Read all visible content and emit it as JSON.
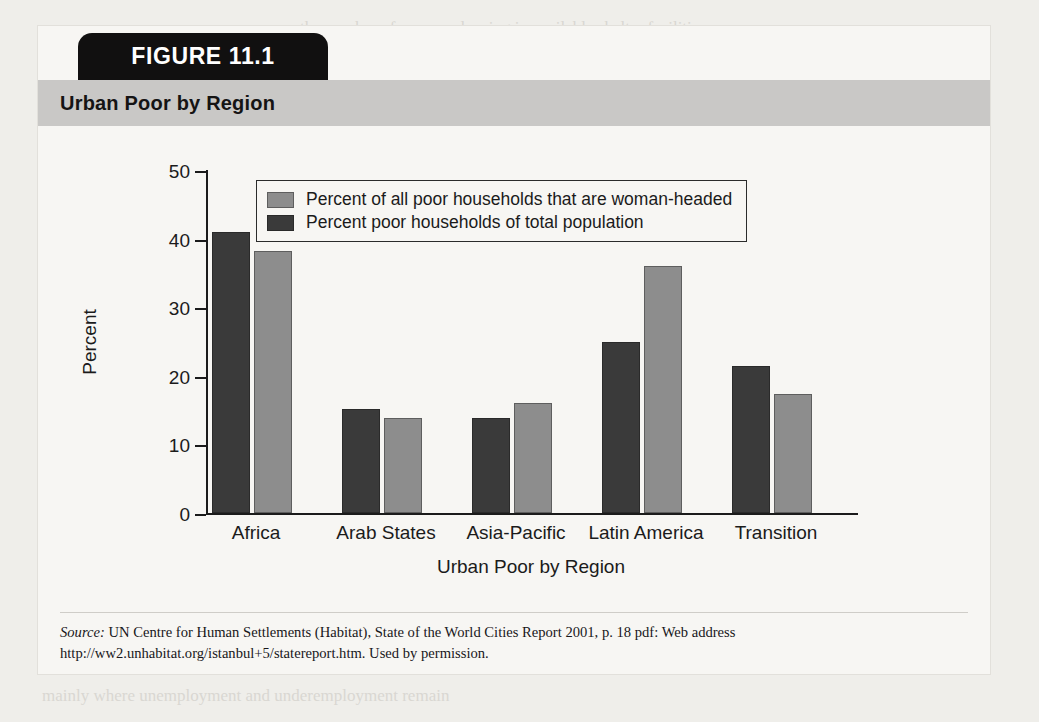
{
  "figure": {
    "tab_label": "FIGURE 11.1",
    "title": "Urban Poor by Region"
  },
  "source": {
    "prefix": "Source:",
    "text": " UN Centre for Human Settlements (Habitat), State of the World Cities Report 2001, p. 18 pdf: Web address http://ww2.unhabitat.org/istanbul+5/statereport.htm. Used by permission."
  },
  "colors": {
    "light_series": "#8d8d8d",
    "dark_series": "#3a3a3a",
    "title_band": "#c9c8c6",
    "tab": "#111010"
  },
  "chart_data": {
    "type": "bar",
    "title": "Urban Poor by Region",
    "xlabel": "Urban Poor by Region",
    "ylabel": "Percent",
    "ylim": [
      0,
      50
    ],
    "yticks": [
      0,
      10,
      20,
      30,
      40,
      50
    ],
    "grid": false,
    "legend_position": "upper-left-inside",
    "categories": [
      "Africa",
      "Arab States",
      "Asia-Pacific",
      "Latin America",
      "Transition"
    ],
    "series": [
      {
        "name": "Percent poor households of total population",
        "color": "#3a3a3a",
        "values": [
          41,
          15.2,
          13.9,
          25,
          21.5
        ]
      },
      {
        "name": "Percent of all poor households that are woman-headed",
        "color": "#8d8d8d",
        "values": [
          38.2,
          13.8,
          16,
          36,
          17.3
        ]
      }
    ]
  },
  "bleed_text": [
    "the number of women sleeping in available shelter facilities",
    "for 1999, the number of homeless women who were turned",
    "and unsheltered women in a city is a difficult task. Obtaining",
    "valid representative data is likewise problematic because",
    "of all use of such services. Advocates and service providers",
    "of individual suffer directly. In general, homeless women",
    "far more time and resources than previously. Available data",
    "at 40, 000 with 15 percent of the population. Some studies",
    "Homelessness among women has risen in recent years",
    "while the percentage of poor households headed by women",
    "mainly where unemployment and underemployment remain"
  ]
}
